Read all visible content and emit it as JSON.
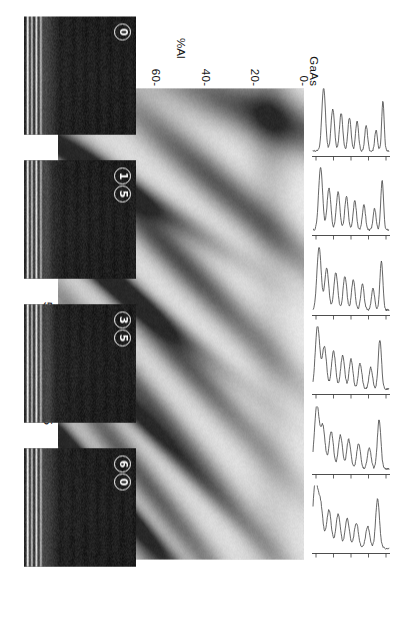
{
  "figure": {
    "kind": "composition-profile-figure",
    "orientation_deg": 90,
    "background": "#ffffff",
    "ink": "#161616"
  },
  "axes": {
    "x": {
      "title": "Distance (nm)",
      "unit": "nm",
      "ticks": [
        0,
        25,
        50,
        75,
        100
      ],
      "tick_labels": [
        "0",
        "25",
        "50",
        "75",
        "100"
      ],
      "range": [
        0,
        107
      ]
    },
    "y": {
      "title": "%Al",
      "ticks": [
        0,
        20,
        40,
        60,
        80,
        100
      ],
      "tick_labels": [
        "0-",
        "20-",
        "40-",
        "60-",
        "80-",
        "100-"
      ],
      "range": [
        0,
        100
      ],
      "start_material": "GaAs",
      "end_material": "AlAs",
      "end_zero_label": "0"
    }
  },
  "chart_data": {
    "type": "heatmap",
    "title": "",
    "xlabel": "Distance (nm)",
    "ylabel": "%Al",
    "xlim": [
      0,
      107
    ],
    "ylim": [
      0,
      100
    ],
    "grid": false,
    "legend": "none",
    "colormap": "grayscale-inverted",
    "bands": [
      {
        "distance_nm": 6,
        "peak_pct_al": 16,
        "darkness": 0.72,
        "slope": 0.1,
        "width_nm": 6.0
      },
      {
        "distance_nm": 18,
        "peak_pct_al": 85,
        "darkness": 0.95,
        "slope": 0.16,
        "width_nm": 3.4
      },
      {
        "distance_nm": 22,
        "peak_pct_al": 34,
        "darkness": 0.66,
        "slope": 0.22,
        "width_nm": 5.6
      },
      {
        "distance_nm": 38,
        "peak_pct_al": 52,
        "darkness": 0.7,
        "slope": 0.26,
        "width_nm": 5.4
      },
      {
        "distance_nm": 40,
        "peak_pct_al": 86,
        "darkness": 0.92,
        "slope": 0.2,
        "width_nm": 3.2
      },
      {
        "distance_nm": 56,
        "peak_pct_al": 58,
        "darkness": 0.66,
        "slope": 0.28,
        "width_nm": 5.2
      },
      {
        "distance_nm": 63,
        "peak_pct_al": 87,
        "darkness": 0.94,
        "slope": 0.26,
        "width_nm": 3.2
      },
      {
        "distance_nm": 72,
        "peak_pct_al": 62,
        "darkness": 0.62,
        "slope": 0.3,
        "width_nm": 5.0
      },
      {
        "distance_nm": 86,
        "peak_pct_al": 88,
        "darkness": 0.93,
        "slope": 0.28,
        "width_nm": 3.2
      },
      {
        "distance_nm": 88,
        "peak_pct_al": 66,
        "darkness": 0.58,
        "slope": 0.32,
        "width_nm": 5.0
      },
      {
        "distance_nm": 100,
        "peak_pct_al": 70,
        "darkness": 0.5,
        "slope": 0.34,
        "width_nm": 5.0
      }
    ]
  },
  "profiles": {
    "count": 6,
    "orientation": "vertical-traces",
    "axis_note": "each trace shares the %Al abscissa of the map below",
    "traces": [
      {
        "index": 1,
        "label": "",
        "peaks_pct_al": [
          8,
          17,
          30,
          42,
          52,
          63,
          74,
          86
        ]
      },
      {
        "index": 2,
        "label": "",
        "peaks_pct_al": [
          9,
          19,
          33,
          45,
          56,
          67,
          79,
          90
        ]
      },
      {
        "index": 3,
        "label": "",
        "peaks_pct_al": [
          10,
          21,
          35,
          47,
          58,
          70,
          82,
          92
        ]
      },
      {
        "index": 4,
        "label": "",
        "peaks_pct_al": [
          12,
          24,
          38,
          50,
          61,
          73,
          85,
          94
        ]
      },
      {
        "index": 5,
        "label": "",
        "peaks_pct_al": [
          13,
          26,
          40,
          53,
          64,
          76,
          87,
          95
        ]
      },
      {
        "index": 6,
        "label": "",
        "peaks_pct_al": [
          15,
          28,
          43,
          55,
          67,
          79,
          90,
          97
        ]
      }
    ]
  },
  "insets": {
    "description": "Dark-field lattice-fringe micrographs of the same superlattice",
    "items": [
      {
        "badge": "0",
        "badge_digits": [
          "0"
        ],
        "alt": "micrograph-0"
      },
      {
        "badge": "15",
        "badge_digits": [
          "1",
          "5"
        ],
        "alt": "micrograph-15"
      },
      {
        "badge": "35",
        "badge_digits": [
          "3",
          "5"
        ],
        "alt": "micrograph-35"
      },
      {
        "badge": "60",
        "badge_digits": [
          "6",
          "0"
        ],
        "alt": "micrograph-60"
      }
    ]
  },
  "caption": {
    "text": ""
  }
}
